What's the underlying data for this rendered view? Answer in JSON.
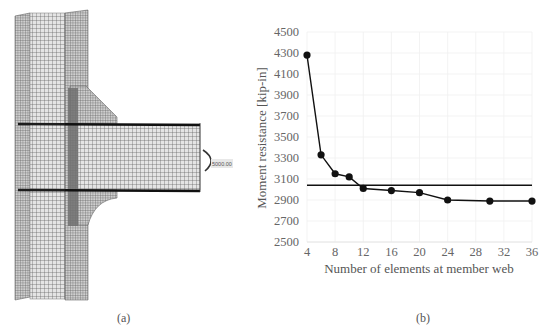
{
  "figure": {
    "panel_a": {
      "caption": "(a)",
      "description": "Finite element mesh of beam-column connection with haunch",
      "moment_label": "5000.00"
    },
    "panel_b": {
      "caption": "(b)"
    }
  },
  "chart_data": {
    "type": "line",
    "title": "",
    "xlabel": "Number of elements at member web",
    "ylabel": "Moment resistance [kip-in]",
    "x_ticks": [
      4,
      8,
      12,
      16,
      20,
      24,
      28,
      32,
      36
    ],
    "y_ticks": [
      2500,
      2700,
      2900,
      3100,
      3300,
      3500,
      3700,
      3900,
      4100,
      4300,
      4500
    ],
    "xlim": [
      4,
      36
    ],
    "ylim": [
      2500,
      4500
    ],
    "grid": true,
    "legend": null,
    "series": [
      {
        "name": "FE moment resistance",
        "marker": "circle",
        "color": "#111111",
        "x": [
          4,
          6,
          8,
          10,
          12,
          16,
          20,
          24,
          30,
          36
        ],
        "values": [
          4280,
          3330,
          3150,
          3120,
          3010,
          2990,
          2970,
          2900,
          2890,
          2890
        ]
      },
      {
        "name": "Reference moment",
        "marker": "none",
        "color": "#111111",
        "x": [
          4,
          36
        ],
        "values": [
          3040,
          3040
        ]
      }
    ]
  }
}
